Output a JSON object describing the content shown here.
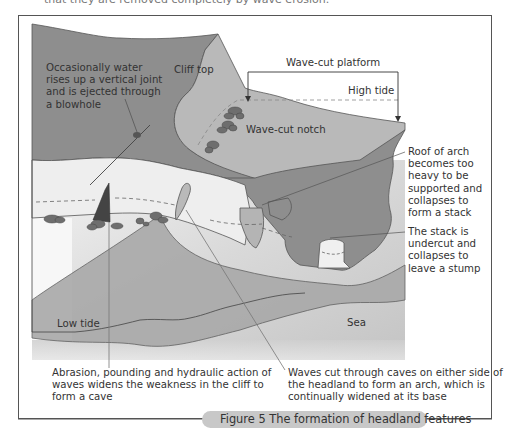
{
  "top_fragment": "that they are removed completely by wave erosion.",
  "figure": {
    "caption": "Figure 5  The formation of headland features",
    "colors": {
      "cliff_dark": "#8e8e8e",
      "cliff_mid": "#b4b4b4",
      "platform_light": "#e6e6e6",
      "sea": "#cfcfcf",
      "rock": "#6e6e6e",
      "frame": "#555555",
      "caption_bg": "#c8c8c8"
    },
    "labels": {
      "cliff_top": "Cliff top",
      "wave_cut_platform": "Wave-cut platform",
      "high_tide": "High tide",
      "wave_cut_notch": "Wave-cut notch",
      "low_tide": "Low tide",
      "sea": "Sea",
      "blowhole": [
        "Occasionally water",
        "rises up a vertical joint",
        "and is ejected through",
        "a blowhole"
      ],
      "stack": [
        "Roof of arch",
        "becomes too",
        "heavy to be",
        "supported and",
        "collapses to",
        "form a stack"
      ],
      "stump": [
        "The stack is",
        "undercut and",
        "collapses to",
        "leave a stump"
      ],
      "cave": [
        "Abrasion, pounding and hydraulic action of",
        "waves widens the weakness in the cliff to",
        "form a cave"
      ],
      "arch": [
        "Waves cut through caves on either side of",
        "the headland to form an arch, which is",
        "continually widened at its base"
      ]
    }
  }
}
